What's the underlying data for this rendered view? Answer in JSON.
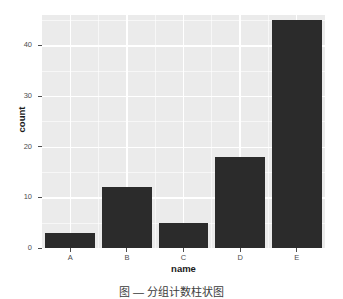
{
  "figure": {
    "caption": "图 — 分组计数柱状图",
    "background_color": "#ffffff"
  },
  "chart_data": {
    "type": "bar",
    "title": "",
    "categories": [
      "A",
      "B",
      "C",
      "D",
      "E"
    ],
    "values": [
      3,
      12,
      5,
      18,
      45
    ],
    "series": [
      {
        "name": "count",
        "values": [
          3,
          12,
          5,
          18,
          45
        ]
      }
    ],
    "xlabel": "name",
    "ylabel": "count",
    "ylim": [
      0,
      46
    ],
    "yticks": [
      0,
      10,
      20,
      30,
      40
    ],
    "ytick_labels": [
      "0",
      "10",
      "20",
      "30",
      "40"
    ],
    "y_minor_ticks": [
      5,
      15,
      25,
      35,
      45
    ],
    "grid": true,
    "legend": false,
    "legend_position": "none",
    "bar_color": "#2b2b2b",
    "panel_background": "#ebebeb",
    "gridline_color": "#ffffff",
    "axis_text_color": "#4d4d4d",
    "axis_title_color": "#1a1a1a"
  }
}
